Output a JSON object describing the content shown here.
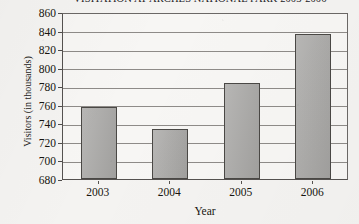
{
  "chart_data": {
    "type": "bar",
    "title": "VISITATION AT ARCHES NATIONAL PARK 2003-2006",
    "xlabel": "Year",
    "ylabel": "Visitors (in thousands)",
    "categories": [
      "2003",
      "2004",
      "2005",
      "2006"
    ],
    "values": [
      758,
      734,
      783,
      836
    ],
    "ylim": [
      680,
      860
    ],
    "ytick_labels": [
      "860",
      "840",
      "820",
      "800",
      "780",
      "760",
      "740",
      "720",
      "700",
      "680"
    ],
    "ytick_values": [
      860,
      840,
      820,
      800,
      780,
      760,
      740,
      720,
      700,
      680
    ],
    "ytick_step": 20,
    "grid": "horizontal",
    "legend": "none",
    "bar_color": "#a9a8a6",
    "bar_border_color": "#4a4845",
    "gridline_color": "#8e8b88",
    "background_color": "#f4f3f1"
  }
}
